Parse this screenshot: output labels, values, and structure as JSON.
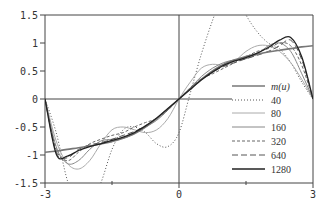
{
  "chart_data": {
    "type": "line",
    "title": "",
    "xlabel": "",
    "ylabel": "",
    "xlim": [
      -3,
      3
    ],
    "ylim": [
      -1.5,
      1.5
    ],
    "x_ticks": [
      "-3",
      "0",
      "3"
    ],
    "y_ticks": [
      "1.5",
      "1",
      "0.5",
      "0",
      "-0.5",
      "-1",
      "-1.5"
    ],
    "grid": false,
    "legend_position": "lower right",
    "legend": [
      "m(u)",
      "40",
      "80",
      "160",
      "320",
      "640",
      "1280"
    ],
    "x": [
      -3,
      -2.75,
      -2.5,
      -2.25,
      -2,
      -1.75,
      -1.5,
      -1.25,
      -1,
      -0.75,
      -0.5,
      -0.25,
      0,
      0.25,
      0.5,
      0.75,
      1,
      1.25,
      1.5,
      1.75,
      2,
      2.25,
      2.5,
      2.75,
      3
    ],
    "series": [
      {
        "name": "m(u)",
        "style": "solid-thick",
        "color": "#555555",
        "values": [
          -0.95,
          -0.93,
          -0.9,
          -0.87,
          -0.84,
          -0.8,
          -0.76,
          -0.7,
          -0.62,
          -0.5,
          -0.35,
          -0.18,
          0,
          0.18,
          0.35,
          0.5,
          0.62,
          0.7,
          0.76,
          0.8,
          0.84,
          0.87,
          0.9,
          0.93,
          0.95
        ]
      },
      {
        "name": "40",
        "style": "dotted",
        "color": "#555555",
        "values": [
          0,
          -0.6,
          -1.45,
          -1.9,
          -1.9,
          -1.5,
          -0.9,
          -0.55,
          -0.5,
          -0.6,
          -0.8,
          -0.85,
          -0.6,
          0.1,
          0.8,
          1.4,
          1.9,
          1.9,
          1.5,
          1.2,
          1.0,
          0.9,
          0.65,
          0.3,
          0
        ]
      },
      {
        "name": "80",
        "style": "solid-thin-light",
        "color": "#aaaaaa",
        "values": [
          0,
          -0.75,
          -1.15,
          -1.25,
          -1.1,
          -0.8,
          -0.55,
          -0.5,
          -0.55,
          -0.6,
          -0.55,
          -0.35,
          0,
          0.3,
          0.55,
          0.62,
          0.6,
          0.68,
          0.85,
          0.95,
          0.95,
          0.85,
          0.65,
          0.35,
          0
        ]
      },
      {
        "name": "160",
        "style": "solid-thin",
        "color": "#888888",
        "values": [
          0,
          -0.85,
          -1.15,
          -1.1,
          -0.9,
          -0.75,
          -0.72,
          -0.7,
          -0.62,
          -0.5,
          -0.38,
          -0.2,
          0,
          0.2,
          0.4,
          0.55,
          0.65,
          0.7,
          0.72,
          0.8,
          0.95,
          1.0,
          0.85,
          0.45,
          0
        ]
      },
      {
        "name": "320",
        "style": "dashed-short",
        "color": "#666666",
        "values": [
          0,
          -0.9,
          -1.1,
          -0.95,
          -0.8,
          -0.72,
          -0.65,
          -0.6,
          -0.5,
          -0.42,
          -0.35,
          -0.2,
          0,
          0.2,
          0.36,
          0.45,
          0.55,
          0.65,
          0.75,
          0.85,
          0.9,
          1.0,
          0.95,
          0.6,
          0
        ]
      },
      {
        "name": "640",
        "style": "dashed-long",
        "color": "#555555",
        "values": [
          0,
          -0.95,
          -1.05,
          -0.9,
          -0.82,
          -0.78,
          -0.72,
          -0.65,
          -0.58,
          -0.48,
          -0.35,
          -0.18,
          0,
          0.18,
          0.35,
          0.48,
          0.58,
          0.65,
          0.72,
          0.78,
          0.85,
          0.95,
          1.05,
          0.7,
          0
        ]
      },
      {
        "name": "1280",
        "style": "solid-dark",
        "color": "#222222",
        "values": [
          0,
          -0.98,
          -1.02,
          -0.92,
          -0.85,
          -0.8,
          -0.74,
          -0.68,
          -0.6,
          -0.48,
          -0.34,
          -0.17,
          0,
          0.17,
          0.34,
          0.48,
          0.6,
          0.68,
          0.74,
          0.82,
          0.92,
          1.05,
          1.1,
          0.75,
          0
        ]
      }
    ]
  },
  "legend": {
    "items": [
      {
        "label": "m(u)"
      },
      {
        "label": "40"
      },
      {
        "label": "80"
      },
      {
        "label": "160"
      },
      {
        "label": "320"
      },
      {
        "label": "640"
      },
      {
        "label": "1280"
      }
    ]
  },
  "axes": {
    "x_ticks": [
      {
        "value": -3,
        "label": "-3"
      },
      {
        "value": 0,
        "label": "0"
      },
      {
        "value": 3,
        "label": "3"
      }
    ],
    "y_ticks": [
      {
        "value": 1.5,
        "label": "1.5"
      },
      {
        "value": 1,
        "label": "1"
      },
      {
        "value": 0.5,
        "label": "0.5"
      },
      {
        "value": 0,
        "label": "0"
      },
      {
        "value": -0.5,
        "label": "-0.5"
      },
      {
        "value": -1,
        "label": "-1"
      },
      {
        "value": -1.5,
        "label": "-1.5"
      }
    ]
  }
}
